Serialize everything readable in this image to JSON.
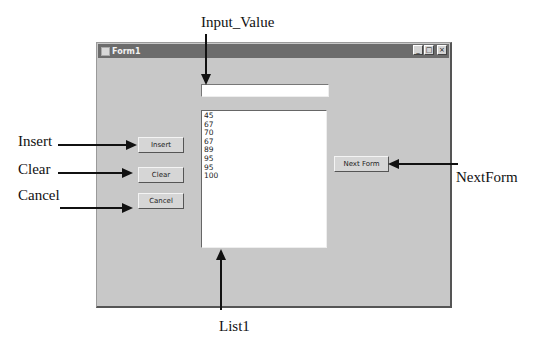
{
  "window": {
    "title": "Form1",
    "controls": {
      "minimize": "_",
      "maximize": "□",
      "close": "×"
    }
  },
  "form": {
    "input_value": "",
    "list_items": [
      "45",
      "67",
      "70",
      "67",
      "89",
      "95",
      "95",
      "100"
    ],
    "buttons": {
      "insert": "Insert",
      "clear": "Clear",
      "cancel": "Cancel",
      "next_form": "Next Form"
    }
  },
  "annotations": {
    "input_value": "Input_Value",
    "insert": "Insert",
    "clear": "Clear",
    "cancel": "Cancel",
    "next_form": "NextForm",
    "list": "List1"
  }
}
